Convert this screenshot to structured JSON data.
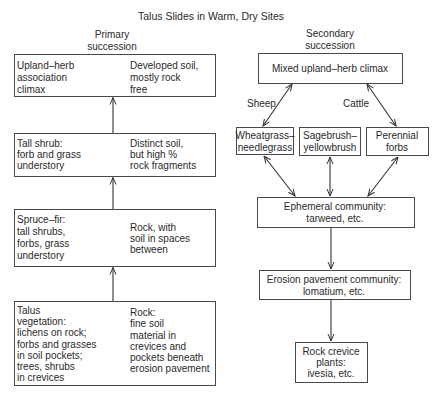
{
  "title": "Talus Slides in Warm, Dry Sites",
  "primary": {
    "heading": [
      "Primary",
      "succession"
    ],
    "stages": [
      {
        "vegetation": [
          "Upland–herb",
          "association",
          "climax"
        ],
        "soil": [
          "Developed soil,",
          "mostly rock",
          "free"
        ]
      },
      {
        "vegetation": [
          "Tall shrub:",
          "forb and grass",
          "understory"
        ],
        "soil": [
          "Distinct soil,",
          "but high %",
          "rock fragments"
        ]
      },
      {
        "vegetation": [
          "Spruce–fir:",
          "tall shrubs,",
          "forbs, grass",
          "understory"
        ],
        "soil": [
          "Rock, with",
          "soil in spaces",
          "between"
        ]
      },
      {
        "vegetation": [
          "Talus",
          "vegetation:",
          "lichens on rock;",
          "forbs and grasses",
          "in soil pockets;",
          "trees, shrubs",
          "in crevices"
        ],
        "soil": [
          "Rock:",
          "fine soil",
          "material in",
          "crevices and",
          "pockets beneath",
          "erosion pavement"
        ]
      }
    ]
  },
  "secondary": {
    "heading": [
      "Secondary",
      "succession"
    ],
    "climax": "Mixed upland–herb climax",
    "grazing_labels": {
      "left": "Sheep",
      "right": "Cattle"
    },
    "mid_communities": [
      [
        "Wheatgrass–",
        "needlegrass"
      ],
      [
        "Sagebrush–",
        "yellowbrush"
      ],
      [
        "Perennial",
        "forbs"
      ]
    ],
    "ephemeral": [
      "Ephemeral community:",
      "tarweed, etc."
    ],
    "erosion": [
      "Erosion pavement community:",
      "lomatium, etc."
    ],
    "crevice": [
      "Rock crevice",
      "plants:",
      "ivesia, etc."
    ]
  },
  "colors": {
    "line": "#4a4a4a",
    "text": "#2a2a2a",
    "background": "#ffffff"
  }
}
